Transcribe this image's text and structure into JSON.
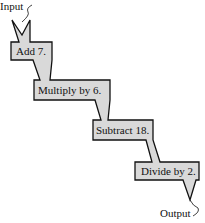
{
  "diagram": {
    "input_label": "Input",
    "output_label": "Output",
    "steps": [
      {
        "label": "Add 7."
      },
      {
        "label": "Multiply by 6."
      },
      {
        "label": "Subtract 18."
      },
      {
        "label": "Divide by 2."
      }
    ],
    "colors": {
      "fill": "#d9d9d9",
      "stroke": "#111111"
    }
  }
}
